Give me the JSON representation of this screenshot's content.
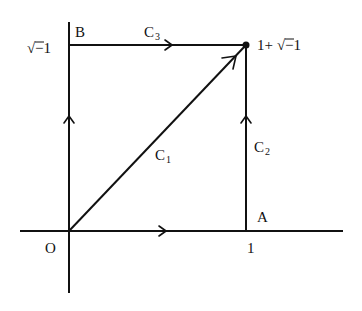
{
  "diagram": {
    "points": {
      "origin": {
        "label": "O",
        "re": 0,
        "im": 0
      },
      "A": {
        "label": "A",
        "re": 1,
        "im": 0
      },
      "B": {
        "label": "B",
        "re": 0,
        "im": 1
      },
      "end": {
        "label": "1+√−1",
        "re": 1,
        "im": 1
      }
    },
    "axis_ticks": {
      "x_tick_label": "1",
      "y_tick_label": "√−1"
    },
    "paths": [
      {
        "name": "C",
        "subscript": "1",
        "from": "O",
        "to": "1+√−1",
        "description": "straight segment"
      },
      {
        "name": "C",
        "subscript": "2",
        "from": "A",
        "to": "1+√−1",
        "description": "vertical segment"
      },
      {
        "name": "C",
        "subscript": "3",
        "from": "B",
        "to": "1+√−1",
        "description": "horizontal segment"
      }
    ],
    "labels": {
      "O": "O",
      "A": "A",
      "B": "B",
      "one": "1",
      "sqrt_symbol": "√",
      "minus_one": "−1",
      "end_prefix": "1+",
      "C": "C",
      "sub1": "1",
      "sub2": "2",
      "sub3": "3"
    }
  }
}
